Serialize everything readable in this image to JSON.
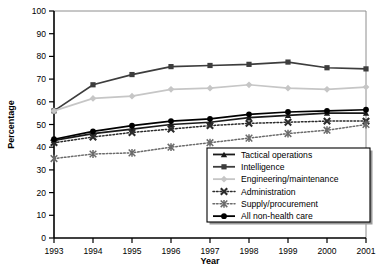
{
  "chart_data": {
    "type": "line",
    "title": "",
    "subtitle": "",
    "xlabel": "Year",
    "ylabel": "Percentage",
    "x": [
      1993,
      1994,
      1995,
      1996,
      1997,
      1998,
      1999,
      2000,
      2001
    ],
    "xtick_labels": [
      "1993",
      "1994",
      "1995",
      "1996",
      "1997",
      "1998",
      "1999",
      "2000",
      "2001"
    ],
    "ytick_labels": [
      "0",
      "10",
      "20",
      "30",
      "40",
      "50",
      "60",
      "70",
      "80",
      "90",
      "100"
    ],
    "ylim": [
      0,
      100
    ],
    "xlim": [
      1993,
      2001
    ],
    "ytick_step": 10,
    "grid": false,
    "legend_position": "bottom-right",
    "series": [
      {
        "name": "Tactical operations",
        "marker": "triangle",
        "line": "solid",
        "color": "#1a1a1a",
        "values": [
          43,
          46,
          48,
          50,
          51,
          53,
          54,
          55,
          55
        ]
      },
      {
        "name": "Intelligence",
        "marker": "square",
        "line": "solid",
        "color": "#3d3d3d",
        "values": [
          56,
          67.5,
          72,
          75.5,
          76,
          76.5,
          77.5,
          75,
          74.5
        ]
      },
      {
        "name": "Engineering/maintenance",
        "marker": "diamond",
        "line": "solid",
        "color": "#c6c6c6",
        "values": [
          56,
          61.5,
          62.5,
          65.5,
          66,
          67.5,
          66,
          65.5,
          66.5
        ]
      },
      {
        "name": "Administration",
        "marker": "x",
        "line": "dotted",
        "color": "#2b2b2b",
        "values": [
          42,
          44.5,
          46.5,
          48,
          49.5,
          50.5,
          51,
          51.5,
          51.5
        ]
      },
      {
        "name": "Supply/procurement",
        "marker": "star",
        "line": "dotted",
        "color": "#6b6b6b",
        "values": [
          35,
          37,
          37.5,
          40,
          42,
          44,
          46,
          47.5,
          50
        ]
      },
      {
        "name": "All non-health care",
        "marker": "circle",
        "line": "solid",
        "color": "#000000",
        "values": [
          43.5,
          47,
          49.5,
          51.5,
          52.5,
          54.5,
          55.5,
          56,
          56.5
        ]
      }
    ]
  },
  "axes": {
    "ylabel": "Percentage",
    "xlabel": "Year"
  }
}
